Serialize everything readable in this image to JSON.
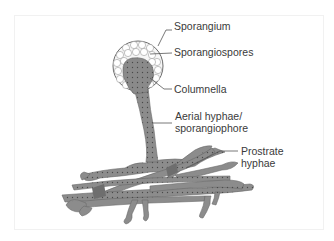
{
  "diagram": {
    "labels": {
      "sporangium": "Sporangium",
      "sporangiospores": "Sporangiospores",
      "columnella": "Columnella",
      "aerial_line1": "Aerial hyphae/",
      "aerial_line2": "sporangiophore",
      "prostrate_line1": "Prostrate",
      "prostrate_line2": "hyphae"
    },
    "colors": {
      "hyphae_fill": "#8c8c8c",
      "hyphae_dark": "#6e6e6e",
      "spore_fill": "#f4f4f4",
      "outline": "#5a5a5a",
      "leader_line": "#555555",
      "text": "#3a3a3a"
    }
  }
}
